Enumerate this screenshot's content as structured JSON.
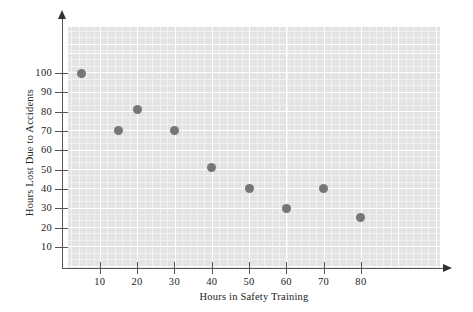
{
  "chart_data": {
    "type": "scatter",
    "title": "",
    "xlabel": "Hours in Safety Training",
    "ylabel": "Hours Lost Due to Accidents",
    "xlim": [
      0,
      90
    ],
    "ylim": [
      0,
      120
    ],
    "grid": true,
    "legend": "none",
    "xticks": [
      10,
      20,
      30,
      40,
      50,
      60,
      70,
      80
    ],
    "yticks": [
      10,
      20,
      30,
      40,
      50,
      60,
      70,
      80,
      90,
      100
    ],
    "xtick_labels": [
      "10",
      "20",
      "30",
      "40",
      "50",
      "60",
      "70",
      "80"
    ],
    "ytick_labels": [
      "10",
      "20",
      "30",
      "40",
      "50",
      "60",
      "70",
      "80",
      "90",
      "100"
    ],
    "points": [
      {
        "x": 5,
        "y": 100
      },
      {
        "x": 15,
        "y": 70
      },
      {
        "x": 20,
        "y": 81
      },
      {
        "x": 30,
        "y": 70
      },
      {
        "x": 40,
        "y": 51
      },
      {
        "x": 50,
        "y": 40
      },
      {
        "x": 60,
        "y": 30
      },
      {
        "x": 70,
        "y": 40
      },
      {
        "x": 80,
        "y": 25
      }
    ],
    "marker": "filled-circle",
    "marker_color": "#767676",
    "plot_background": "#e3e3e3",
    "gridline_color": "#ffffff",
    "axis_color": "#555555"
  }
}
